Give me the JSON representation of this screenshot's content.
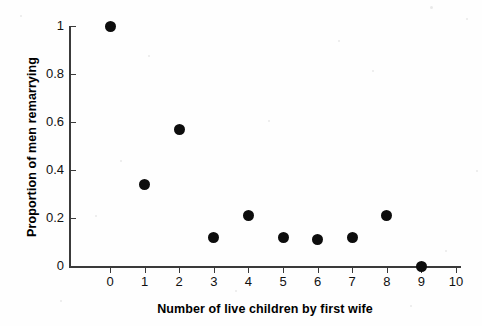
{
  "chart_data": {
    "type": "scatter",
    "title": "",
    "xlabel": "Number of live children by first wife",
    "ylabel": "Proportion of men remarrying",
    "x": [
      0,
      1,
      2,
      3,
      4,
      5,
      6,
      7,
      8,
      9
    ],
    "values": [
      1.0,
      0.34,
      0.57,
      0.12,
      0.21,
      0.12,
      0.11,
      0.12,
      0.21,
      0.0
    ],
    "series": [
      {
        "name": "Proportion of men remarrying",
        "values": [
          1.0,
          0.34,
          0.57,
          0.12,
          0.21,
          0.12,
          0.11,
          0.12,
          0.21,
          0.0
        ]
      }
    ],
    "xlim": [
      -0.7,
      10.1
    ],
    "ylim": [
      0,
      1
    ],
    "xticks": [
      "0",
      "1",
      "2",
      "3",
      "4",
      "5",
      "6",
      "7",
      "8",
      "9",
      "10"
    ],
    "xtick_values": [
      0,
      1,
      2,
      3,
      4,
      5,
      6,
      7,
      8,
      9,
      10
    ],
    "yticks": [
      "0",
      "0.2",
      "0.4",
      "0.6",
      "0.8",
      "1"
    ],
    "ytick_values": [
      0,
      0.2,
      0.4,
      0.6,
      0.8,
      1
    ],
    "grid": false,
    "legend": false,
    "marker": "filled-circle",
    "marker_color": "#0d0d0d",
    "axis_color": "#3a3a3a",
    "background": "#ffffff"
  }
}
